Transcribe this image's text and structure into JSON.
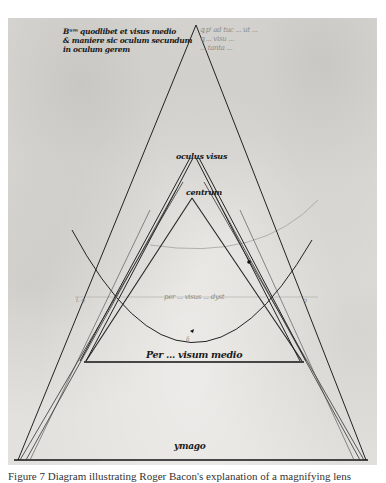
{
  "figure": {
    "type": "manuscript-diagram",
    "colors": {
      "parchment": "#e3e1dd",
      "ink": "#1a1a1a",
      "faint_ink": "#8a8a86",
      "page_background": "#ffffff"
    },
    "annotations": {
      "top_left_gloss": [
        "Bᵘᵐ quodlibet et visus medio",
        "& maniere sic oculum secundum",
        "in oculum gerem"
      ],
      "top_right_gloss": [
        "ꝗ pᵗ ad tuc ... ut ...",
        "ꝗ ... visu ...",
        "... tanta ..."
      ],
      "apex_upper_label": "oculus visus",
      "apex_lower_label": "centrum",
      "chord_label": "per ... visus ... dyst",
      "tick_left": "l. ꝯ",
      "tick_right": "ꝯ",
      "arc_mark": "δ",
      "base_label": "Per ... visum medio",
      "bottom_label": "ymago"
    }
  },
  "caption": {
    "text": "Figure 7  Diagram illustrating Roger Bacon's explanation of a magnifying lens"
  }
}
